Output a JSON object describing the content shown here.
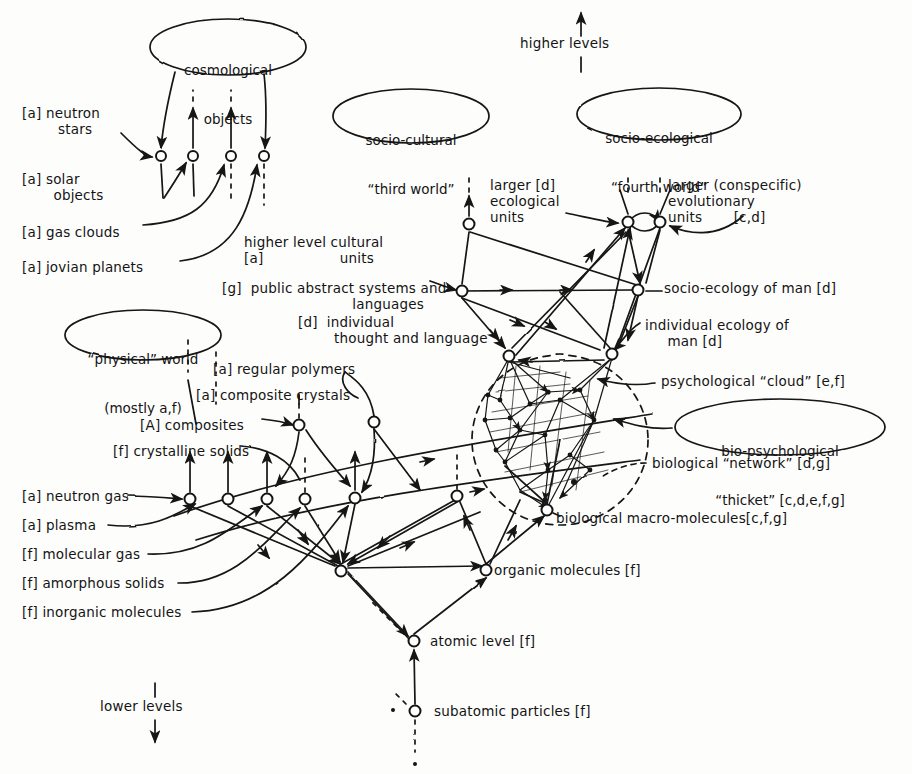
{
  "diagram": {
    "type": "hand-drawn network diagram",
    "ink_color": "#141414",
    "paper_color": "#fdfdfc"
  },
  "axis_notes": {
    "higher": "higher levels",
    "lower": "lower levels"
  },
  "ellipses": [
    {
      "id": "cosmological",
      "line1": "cosmological",
      "line2": "objects",
      "cx": 228,
      "cy": 47,
      "rx": 78,
      "ry": 28
    },
    {
      "id": "socio-cultural",
      "line1": "socio-cultural",
      "line2": "“third world”",
      "cx": 411,
      "cy": 116,
      "rx": 78,
      "ry": 27
    },
    {
      "id": "socio-ecological",
      "line1": "socio-ecological",
      "line2": "“fourth world”",
      "cx": 659,
      "cy": 114,
      "rx": 82,
      "ry": 26
    },
    {
      "id": "physical-world",
      "line1": "“physical” world",
      "line2": "(mostly a,f)",
      "cx": 143,
      "cy": 335,
      "rx": 78,
      "ry": 25
    },
    {
      "id": "bio-psych-thicket",
      "line1": "bio-psychological",
      "line2": "“thicket” [c,d,e,f,g]",
      "cx": 780,
      "cy": 427,
      "rx": 105,
      "ry": 28
    }
  ],
  "left_labels": [
    {
      "id": "neutron-stars",
      "text": "[a] neutron\n        stars",
      "x": 22,
      "y": 106,
      "align": "left"
    },
    {
      "id": "solar-objects",
      "text": "[a] solar\n       objects",
      "x": 22,
      "y": 172,
      "align": "left"
    },
    {
      "id": "gas-clouds",
      "text": "[a] gas clouds",
      "x": 22,
      "y": 225,
      "align": "left"
    },
    {
      "id": "jovian-planets",
      "text": "[a] jovian planets",
      "x": 22,
      "y": 260,
      "align": "left"
    },
    {
      "id": "regular-polymers",
      "text": "[a] regular polymers",
      "x": 213,
      "y": 362,
      "align": "left"
    },
    {
      "id": "composite-crystals",
      "text": "[a] composite crystals",
      "x": 196,
      "y": 388,
      "align": "left"
    },
    {
      "id": "composites",
      "text": "[A] composites",
      "x": 140,
      "y": 418,
      "align": "left"
    },
    {
      "id": "crystalline-solids",
      "text": "[f] crystalline solids",
      "x": 113,
      "y": 444,
      "align": "left"
    },
    {
      "id": "neutron-gas",
      "text": "[a] neutron gas",
      "x": 22,
      "y": 495,
      "align": "left"
    },
    {
      "id": "plasma",
      "text": "[a] plasma",
      "x": 22,
      "y": 524,
      "align": "left"
    },
    {
      "id": "molecular-gas",
      "text": "[f] molecular gas",
      "x": 22,
      "y": 553,
      "align": "left"
    },
    {
      "id": "amorphous-solids",
      "text": "[f] amorphous solids",
      "x": 22,
      "y": 582,
      "align": "left"
    },
    {
      "id": "inorganic-molecules",
      "text": "[f] inorganic molecules",
      "x": 22,
      "y": 611,
      "align": "left"
    }
  ],
  "center_labels": [
    {
      "id": "higher-level-cultural-units",
      "text": "higher level cultural\n[a]                 units",
      "x": 244,
      "y": 235,
      "align": "left"
    },
    {
      "id": "public-abstract-systems",
      "text": "[g]  public abstract systems and\n                             languages",
      "x": 222,
      "y": 281,
      "align": "left"
    },
    {
      "id": "individual-thought",
      "text": "[d]  individual\n        thought and language",
      "x": 298,
      "y": 315,
      "align": "left"
    },
    {
      "id": "larger-ecological-units",
      "text": "larger [d]\necological\nunits",
      "x": 490,
      "y": 178,
      "align": "left"
    },
    {
      "id": "larger-evolutionary-units",
      "text": "larger (conspecific)\nevolutionary\nunits       [c,d]",
      "x": 668,
      "y": 178,
      "align": "left"
    }
  ],
  "right_labels": [
    {
      "id": "socio-ecology-of-man",
      "text": "socio-ecology of man [d]",
      "x": 664,
      "y": 284,
      "align": "left"
    },
    {
      "id": "individual-ecology-of-man",
      "text": "individual ecology of\n     man [d]",
      "x": 645,
      "y": 322,
      "align": "left"
    },
    {
      "id": "psychological-cloud",
      "text": "psychological “cloud” [e,f]",
      "x": 661,
      "y": 378,
      "align": "left"
    },
    {
      "id": "biological-network",
      "text": "biological “network” [d,g]",
      "x": 652,
      "y": 463,
      "align": "left"
    },
    {
      "id": "biological-macromolecules",
      "text": "biological macro-molecules[c,f,g]",
      "x": 556,
      "y": 516,
      "align": "left"
    },
    {
      "id": "organic-molecules",
      "text": "organic molecules [f]",
      "x": 494,
      "y": 569,
      "align": "left"
    },
    {
      "id": "atomic-level",
      "text": "atomic level [f]",
      "x": 430,
      "y": 641,
      "align": "left"
    },
    {
      "id": "subatomic-particles",
      "text": "subatomic particles [f]",
      "x": 434,
      "y": 711,
      "align": "left"
    }
  ],
  "level_markers": {
    "higher_levels": {
      "text": "higher levels",
      "x": 580,
      "y": 44
    },
    "lower_levels": {
      "text": "lower levels",
      "x": 110,
      "y": 707
    }
  },
  "nodes": [
    {
      "id": "cosmo-n1",
      "x": 161,
      "y": 156
    },
    {
      "id": "cosmo-n2",
      "x": 193,
      "y": 156
    },
    {
      "id": "cosmo-n3",
      "x": 231,
      "y": 156
    },
    {
      "id": "cosmo-n4",
      "x": 264,
      "y": 156
    },
    {
      "id": "eco-units",
      "x": 469,
      "y": 224
    },
    {
      "id": "evo-units-l",
      "x": 628,
      "y": 222
    },
    {
      "id": "evo-units-r",
      "x": 660,
      "y": 222
    },
    {
      "id": "public-abstract",
      "x": 462,
      "y": 291
    },
    {
      "id": "socio-eco-man",
      "x": 638,
      "y": 290
    },
    {
      "id": "ind-thought",
      "x": 509,
      "y": 355
    },
    {
      "id": "ind-eco-man",
      "x": 612,
      "y": 354
    },
    {
      "id": "composites",
      "x": 299,
      "y": 425
    },
    {
      "id": "comp-crystals",
      "x": 374,
      "y": 422
    },
    {
      "id": "cryst-solids",
      "x": 190,
      "y": 499
    },
    {
      "id": "ng-2",
      "x": 228,
      "y": 499
    },
    {
      "id": "ng-3",
      "x": 267,
      "y": 499
    },
    {
      "id": "ng-4",
      "x": 305,
      "y": 499
    },
    {
      "id": "ng-5",
      "x": 355,
      "y": 498
    },
    {
      "id": "ng-6",
      "x": 457,
      "y": 496
    },
    {
      "id": "bio-macro",
      "x": 547,
      "y": 510
    },
    {
      "id": "molecular-hub",
      "x": 341,
      "y": 571
    },
    {
      "id": "organic-mol",
      "x": 486,
      "y": 570
    },
    {
      "id": "atomic",
      "x": 414,
      "y": 641
    },
    {
      "id": "subatomic",
      "x": 415,
      "y": 711
    }
  ],
  "regions": [
    {
      "id": "thicket-dashed-ellipse",
      "cx": 560,
      "cy": 440,
      "rx": 88,
      "ry": 85,
      "style": "dashed"
    }
  ]
}
